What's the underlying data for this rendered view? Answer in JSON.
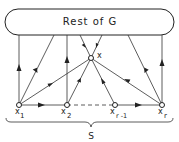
{
  "diagram": {
    "box_label": "Rest of G",
    "set_label": "S",
    "center_node": {
      "id": "x",
      "label": "x"
    },
    "bottom_nodes": [
      {
        "id": "x1",
        "base": "x",
        "sub": "1"
      },
      {
        "id": "x2",
        "base": "x",
        "sub": "2"
      },
      {
        "id": "xr-1",
        "base": "x",
        "sub": "r -1"
      },
      {
        "id": "xr",
        "base": "x",
        "sub": "r"
      }
    ],
    "edges": [
      {
        "from": "x1",
        "to": "Rest of G"
      },
      {
        "from": "Rest of G",
        "to": "x1"
      },
      {
        "from": "x2",
        "to": "Rest of G"
      },
      {
        "from": "xr",
        "to": "Rest of G"
      },
      {
        "from": "Rest of G",
        "to": "xr"
      },
      {
        "from": "Rest of G",
        "to": "x"
      },
      {
        "from": "Rest of G",
        "to": "x"
      },
      {
        "from": "x1",
        "to": "x"
      },
      {
        "from": "x2",
        "to": "x"
      },
      {
        "from": "xr-1",
        "to": "x"
      },
      {
        "from": "xr",
        "to": "x"
      },
      {
        "from": "x1",
        "to": "x2"
      },
      {
        "from": "x2",
        "to": "xr-1",
        "style": "dashed"
      },
      {
        "from": "xr-1",
        "to": "xr"
      }
    ],
    "colors": {
      "stroke": "#222222",
      "background": "#ffffff"
    }
  }
}
